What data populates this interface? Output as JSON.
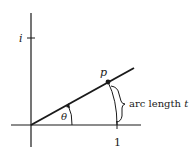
{
  "diagram": {
    "labels": {
      "imag_unit": "i",
      "point": "p",
      "angle": "θ",
      "unit_tick": "1",
      "arc_prefix": "arc length ",
      "arc_var": "t"
    },
    "colors": {
      "ink": "#1a1a1a",
      "background": "#ffffff"
    }
  }
}
